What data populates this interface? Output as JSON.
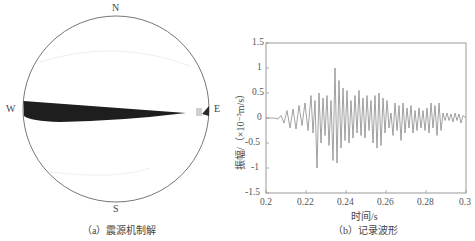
{
  "panel_a": {
    "compass": {
      "north": "N",
      "south": "S",
      "west": "W",
      "east": "E"
    },
    "caption": "（a）震源机制解",
    "beachball": {
      "center": [
        116,
        109
      ],
      "radius": 93,
      "fill_color": "#1e1e1e",
      "outline_color": "#777777"
    }
  },
  "panel_b": {
    "caption": "（b）记录波形",
    "ylabel": "振幅/（×10⁻³m/s）",
    "xlabel": "时间/s",
    "yticks": [
      "1.5",
      "1",
      "0.5",
      "0",
      "-0.5",
      "-1",
      "-1.5"
    ],
    "xticks": [
      "0.2",
      "0.22",
      "0.24",
      "0.26",
      "0.28",
      "0.3"
    ]
  },
  "chart_data": [
    {
      "type": "other",
      "title": "震源机制解",
      "caption": "（a）震源机制解",
      "description": "Focal mechanism beachball (lower-hemisphere projection) with compass labels N, S, W, E; a thin dark compressional wedge extends from W toward E, plus a small dark triangle at the E edge.",
      "labels": [
        "N",
        "S",
        "W",
        "E"
      ]
    },
    {
      "type": "line",
      "title": "记录波形",
      "caption": "（b）记录波形",
      "xlabel": "时间/s",
      "ylabel": "振幅/（×10⁻³m/s）",
      "xlim": [
        0.2,
        0.3
      ],
      "ylim": [
        -1.5,
        1.5
      ],
      "xticks": [
        0.2,
        0.22,
        0.24,
        0.26,
        0.28,
        0.3
      ],
      "yticks": [
        -1.5,
        -1,
        -0.5,
        0,
        0.5,
        1,
        1.5
      ],
      "grid": false,
      "legend": null,
      "series": [
        {
          "name": "waveform",
          "color": "#8a8a8a",
          "x": [
            0.2,
            0.204,
            0.206,
            0.2075,
            0.209,
            0.2105,
            0.212,
            0.2135,
            0.215,
            0.2165,
            0.218,
            0.2195,
            0.221,
            0.2225,
            0.2235,
            0.2245,
            0.2255,
            0.2265,
            0.2275,
            0.2285,
            0.2295,
            0.2305,
            0.2315,
            0.2325,
            0.2335,
            0.2345,
            0.2355,
            0.2365,
            0.2375,
            0.2385,
            0.2395,
            0.2405,
            0.2415,
            0.2425,
            0.2435,
            0.2445,
            0.2455,
            0.2465,
            0.2475,
            0.2485,
            0.2495,
            0.2505,
            0.2515,
            0.2525,
            0.2535,
            0.2545,
            0.2555,
            0.2565,
            0.2575,
            0.2585,
            0.2595,
            0.2605,
            0.2615,
            0.2625,
            0.2635,
            0.2645,
            0.2655,
            0.2665,
            0.2675,
            0.2685,
            0.2695,
            0.2705,
            0.2715,
            0.2725,
            0.2735,
            0.2745,
            0.2755,
            0.2765,
            0.2775,
            0.2785,
            0.2795,
            0.2805,
            0.2815,
            0.2825,
            0.2835,
            0.2845,
            0.2855,
            0.2865,
            0.2875,
            0.2885,
            0.2895,
            0.2905,
            0.2915,
            0.2925,
            0.2935,
            0.2945,
            0.2955,
            0.2965,
            0.2975,
            0.2985,
            0.3
          ],
          "y": [
            0.0,
            0.0,
            -0.02,
            0.05,
            -0.1,
            0.15,
            -0.2,
            0.18,
            -0.22,
            0.25,
            -0.15,
            0.3,
            -0.25,
            0.45,
            -0.3,
            0.35,
            -1.0,
            0.5,
            -0.5,
            0.4,
            -0.35,
            0.45,
            -0.55,
            0.35,
            -0.85,
            1.0,
            -0.9,
            0.75,
            -0.6,
            0.6,
            -0.45,
            0.55,
            -0.5,
            0.35,
            -0.4,
            0.45,
            -0.3,
            0.55,
            -0.35,
            0.4,
            -0.4,
            0.45,
            -0.25,
            0.35,
            -0.5,
            0.45,
            -0.6,
            0.5,
            -0.55,
            0.4,
            -0.3,
            0.35,
            -0.2,
            0.1,
            -0.35,
            0.3,
            -0.25,
            0.25,
            -0.45,
            0.3,
            -0.3,
            0.2,
            -0.2,
            0.25,
            -0.3,
            0.15,
            -0.25,
            0.2,
            -0.2,
            0.15,
            -0.25,
            0.2,
            -0.3,
            0.3,
            -0.2,
            0.25,
            -0.35,
            0.3,
            -0.25,
            0.1,
            -0.05,
            0.1,
            -0.05,
            0.08,
            -0.08,
            0.1,
            -0.05,
            0.08,
            -0.1,
            0.05,
            0.0
          ]
        }
      ]
    }
  ]
}
